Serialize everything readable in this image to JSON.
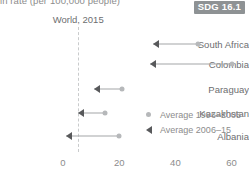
{
  "subtitle_clipped": "in rate (per 100,000 people)",
  "badge": {
    "label": "SDG 16.1",
    "background": "#8e9294",
    "text_color": "#ffffff"
  },
  "panel": {
    "header": "World, 2015"
  },
  "legend": {
    "items": [
      {
        "label": "Average 1996–2005",
        "marker": "dot",
        "color": "#b6b8ba"
      },
      {
        "label": "Average 2006–15",
        "marker": "arrow-left",
        "color": "#58595b"
      }
    ]
  },
  "chart_data": {
    "type": "line",
    "title": "World, 2015",
    "subtitle": "in rate (per 100,000 people)",
    "xlabel": "",
    "ylabel": "",
    "categories": [
      "South Africa",
      "Colombia",
      "Paraguay",
      "Kazakhstan",
      "Albania"
    ],
    "series": [
      {
        "name": "Average 1996–2005",
        "marker": "dot",
        "color": "#b6b8ba",
        "values": [
          48,
          60,
          21,
          15,
          20
        ]
      },
      {
        "name": "Average 2006–15",
        "marker": "arrow-left",
        "color": "#58595b",
        "values": [
          32,
          31,
          11,
          5.5,
          1
        ]
      }
    ],
    "xlim": [
      0,
      64
    ],
    "xticks": [
      0,
      20,
      40,
      60
    ],
    "xtick_labels": [
      "0",
      "20",
      "40",
      "60"
    ],
    "reference_line": {
      "value": 5.4,
      "style": "dashed",
      "color": "#c9cbcc",
      "label": "World, 2015"
    },
    "grid": false,
    "legend_position": "inside-lower-right"
  },
  "axis_geometry": {
    "x0_px": 63,
    "px_per_unit": 2.81,
    "row_y_px": [
      44,
      64,
      89,
      113,
      136
    ],
    "label_right_px": 58,
    "tick_y_px": 157
  }
}
